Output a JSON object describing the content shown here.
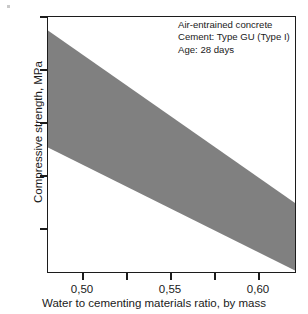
{
  "chart_data": {
    "type": "area",
    "title": "",
    "xlabel": "Water to cementing materials ratio, by mass",
    "ylabel": "Compressive strength, MPa",
    "xlim": [
      0.48,
      0.6216
    ],
    "ylim": [
      18.0,
      35.0
    ],
    "grid": false,
    "legend_position": "none",
    "decimal_separator": ",",
    "x_ticks": [
      {
        "value": 0.5,
        "label": "0,50",
        "major": true
      },
      {
        "value": 0.525,
        "label": "",
        "major": false
      },
      {
        "value": 0.55,
        "label": "0,55",
        "major": true
      },
      {
        "value": 0.575,
        "label": "",
        "major": false
      },
      {
        "value": 0.6,
        "label": "0,60",
        "major": true
      }
    ],
    "y_ticks": [
      {
        "value": 35,
        "label": "35",
        "major": true
      },
      {
        "value": 31.5,
        "label": "",
        "major": false
      },
      {
        "value": 28,
        "label": "28",
        "major": true
      },
      {
        "value": 24.5,
        "label": "",
        "major": false
      },
      {
        "value": 21,
        "label": "21",
        "major": true
      }
    ],
    "band": {
      "name": "Typical strength range",
      "color": "#808080",
      "x": [
        0.48,
        0.6216
      ],
      "upper": [
        34.1,
        22.6
      ],
      "lower": [
        26.3,
        18.1
      ]
    },
    "annotations": [
      "Air-entrained concrete",
      "Cement: Type GU (Type I)",
      "Age: 28 days"
    ]
  },
  "colors": {
    "band": "#808080",
    "axis": "#1c1c1c",
    "text": "#1a1a1a",
    "background": "#ffffff"
  }
}
